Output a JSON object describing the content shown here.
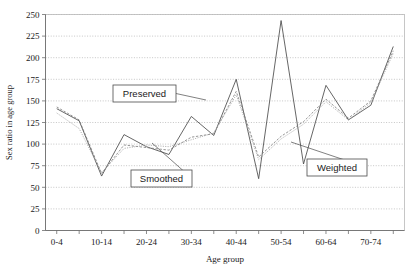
{
  "chart_data": {
    "type": "line",
    "title": "",
    "xlabel": "Age group",
    "ylabel": "Sex ratio in age group",
    "ylim": [
      0,
      250
    ],
    "ytick_step": 25,
    "yticks": [
      0,
      25,
      50,
      75,
      100,
      125,
      150,
      175,
      200,
      225,
      250
    ],
    "grid": true,
    "legend_position": "inline-callouts",
    "categories": [
      "0-4",
      "5-9",
      "10-14",
      "15-19",
      "20-24",
      "25-29",
      "30-34",
      "35-39",
      "40-44",
      "45-49",
      "50-54",
      "55-59",
      "60-64",
      "65-69",
      "70-74",
      "75+"
    ],
    "xtick_labels_shown": [
      "0-4",
      "10-14",
      "20-24",
      "30-34",
      "40-44",
      "50-54",
      "60-64",
      "70-74"
    ],
    "series": [
      {
        "name": "Preserved",
        "style": "solid",
        "color": "#4a4a4a",
        "values": [
          141,
          127,
          63,
          111,
          97,
          88,
          132,
          110,
          175,
          60,
          243,
          77,
          168,
          128,
          145,
          213
        ]
      },
      {
        "name": "Smoothed",
        "style": "dashed",
        "color": "#7a7a7a",
        "values": [
          143,
          128,
          66,
          99,
          96,
          93,
          108,
          112,
          161,
          85,
          109,
          126,
          152,
          130,
          150,
          208
        ]
      },
      {
        "name": "Weighted",
        "style": "dotted",
        "color": "#9a9a9a",
        "values": [
          136,
          118,
          67,
          95,
          99,
          97,
          105,
          113,
          157,
          82,
          106,
          123,
          149,
          128,
          148,
          205
        ]
      }
    ],
    "annotations": [
      {
        "label": "Preserved",
        "x_box": 113,
        "y_box": 85,
        "w": 63,
        "h": 17,
        "leader_to_x": 206,
        "leader_to_y": 100
      },
      {
        "label": "Smoothed",
        "x_box": 131,
        "y_box": 170,
        "w": 61,
        "h": 17,
        "leader_to_x": 152,
        "leader_to_y": 143
      },
      {
        "label": "Weighted",
        "x_box": 307,
        "y_box": 159,
        "w": 60,
        "h": 17,
        "leader_to_x": 291,
        "leader_to_y": 142
      }
    ]
  }
}
